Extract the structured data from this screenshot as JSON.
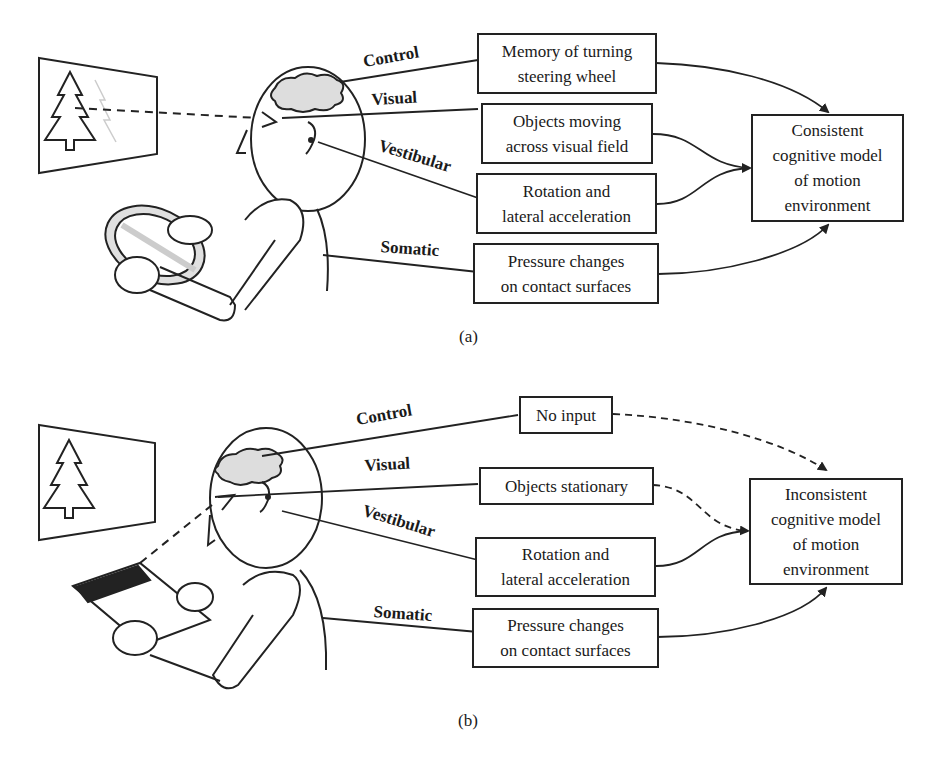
{
  "panels": [
    {
      "id": "a",
      "caption": "(a)",
      "channels": {
        "control": "Control",
        "visual": "Visual",
        "vestibular": "Vestibular",
        "somatic": "Somatic"
      },
      "boxes": {
        "control": "Memory of turning\nsteering wheel",
        "visual": "Objects moving\nacross visual field",
        "vestibular": "Rotation and\nlateral acceleration",
        "somatic": "Pressure changes\non contact surfaces"
      },
      "result": "Consistent\ncognitive model\nof motion\nenvironment",
      "scene": "driver-with-steering-wheel",
      "arrow_styles": {
        "control": "solid",
        "visual": "solid",
        "vestibular": "solid",
        "somatic": "solid"
      }
    },
    {
      "id": "b",
      "caption": "(b)",
      "channels": {
        "control": "Control",
        "visual": "Visual",
        "vestibular": "Vestibular",
        "somatic": "Somatic"
      },
      "boxes": {
        "control": "No input",
        "visual": "Objects stationary",
        "vestibular": "Rotation and\nlateral acceleration",
        "somatic": "Pressure changes\non contact surfaces"
      },
      "result": "Inconsistent\ncognitive model\nof motion\nenvironment",
      "scene": "passenger-reading",
      "newspaper_text": "EXCLUSIVE!",
      "arrow_styles": {
        "control": "dashed",
        "visual": "dashed",
        "vestibular": "solid",
        "somatic": "solid"
      }
    }
  ]
}
